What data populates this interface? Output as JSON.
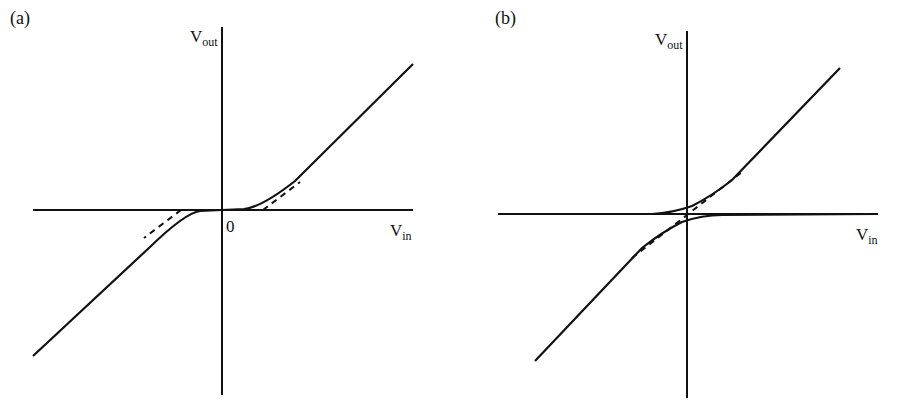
{
  "figure": {
    "stroke_color": "#111111",
    "background": "#ffffff",
    "panels": [
      {
        "id": "a",
        "tag": "(a)",
        "y_axis_label": {
          "main": "V",
          "sub": "out"
        },
        "x_axis_label": {
          "main": "V",
          "sub": "in"
        },
        "origin_label": "0",
        "description": "Transfer curve with dead zone: output stays near zero around origin, smoothly joining linear asymptotes offset horizontally (dashed)."
      },
      {
        "id": "b",
        "tag": "(b)",
        "y_axis_label": {
          "main": "V",
          "sub": "out"
        },
        "x_axis_label": {
          "main": "V",
          "sub": "in"
        },
        "description": "Two branches: each is zero on one side and follows a linear asymptote on the other, offset vertically from origin (dashed asymptote through origin)."
      }
    ]
  }
}
